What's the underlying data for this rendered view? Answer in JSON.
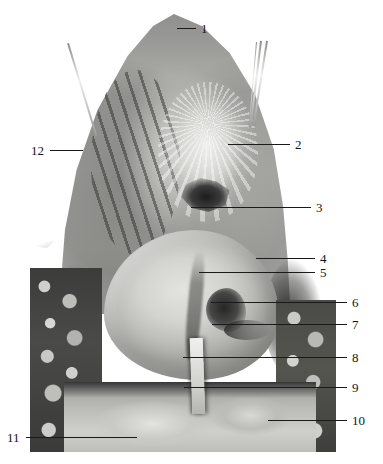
{
  "figure": {
    "type": "anatomical-dissection-photograph",
    "background_color": "#ffffff",
    "photo": {
      "left": 28,
      "top": 0,
      "width": 309,
      "height": 452,
      "tone_range": [
        "#1d1d1d",
        "#f0f0ee"
      ]
    }
  },
  "labels": [
    {
      "id": "1",
      "text": "1",
      "x": 201,
      "y": 28,
      "side": "right",
      "lead": {
        "x1": 177,
        "y1": 28,
        "x2": 196,
        "y2": 28
      }
    },
    {
      "id": "2",
      "text": "2",
      "x": 295,
      "y": 144,
      "side": "right",
      "lead": {
        "x1": 228,
        "y1": 144,
        "x2": 290,
        "y2": 144
      }
    },
    {
      "id": "3",
      "text": "3",
      "x": 316,
      "y": 207,
      "side": "right",
      "lead": {
        "x1": 191,
        "y1": 207,
        "x2": 311,
        "y2": 207
      }
    },
    {
      "id": "4",
      "text": "4",
      "x": 320,
      "y": 258,
      "side": "right",
      "lead": {
        "x1": 256,
        "y1": 258,
        "x2": 315,
        "y2": 258
      }
    },
    {
      "id": "5",
      "text": "5",
      "x": 320,
      "y": 272,
      "side": "right",
      "lead": {
        "x1": 199,
        "y1": 272,
        "x2": 315,
        "y2": 272
      }
    },
    {
      "id": "6",
      "text": "6",
      "x": 352,
      "y": 302,
      "side": "right",
      "lead": {
        "x1": 211,
        "y1": 302,
        "x2": 347,
        "y2": 302
      }
    },
    {
      "id": "7",
      "text": "7",
      "x": 352,
      "y": 324,
      "side": "right",
      "lead": {
        "x1": 212,
        "y1": 324,
        "x2": 347,
        "y2": 324
      }
    },
    {
      "id": "8",
      "text": "8",
      "x": 352,
      "y": 357,
      "side": "right",
      "lead": {
        "x1": 183,
        "y1": 357,
        "x2": 347,
        "y2": 357
      }
    },
    {
      "id": "9",
      "text": "9",
      "x": 352,
      "y": 387,
      "side": "right",
      "lead": {
        "x1": 184,
        "y1": 387,
        "x2": 347,
        "y2": 387
      }
    },
    {
      "id": "10",
      "text": "10",
      "x": 352,
      "y": 420,
      "side": "right",
      "lead": {
        "x1": 268,
        "y1": 420,
        "x2": 347,
        "y2": 420
      }
    },
    {
      "id": "11",
      "text": "11",
      "x": 7,
      "y": 437,
      "side": "left",
      "lead": {
        "x1": 26,
        "y1": 437,
        "x2": 137,
        "y2": 437
      }
    },
    {
      "id": "12",
      "text": "12",
      "x": 31,
      "y": 150,
      "side": "left",
      "lead": {
        "x1": 50,
        "y1": 150,
        "x2": 83,
        "y2": 150
      }
    }
  ],
  "instruments": [
    {
      "name": "probe-shaft-left",
      "x": 69,
      "y": 43,
      "length": 97,
      "angle": 73,
      "thickness": 2
    },
    {
      "name": "probe-shaft-right-outer",
      "x": 268,
      "y": 41,
      "length": 86,
      "angle": 99,
      "thickness": 2
    },
    {
      "name": "probe-shaft-right-inner",
      "x": 262,
      "y": 41,
      "length": 88,
      "angle": 97,
      "thickness": 2
    },
    {
      "name": "probe-shaft-right-third",
      "x": 257,
      "y": 42,
      "length": 86,
      "angle": 95,
      "thickness": 1
    }
  ]
}
